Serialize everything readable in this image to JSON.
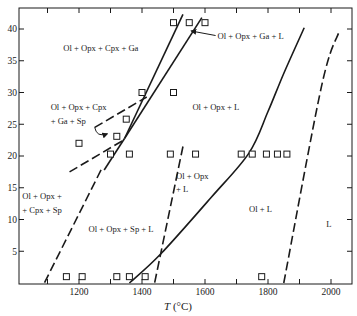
{
  "figure": {
    "xlabel_symbol": "T",
    "xlabel_unit": " (°C)",
    "colors": {
      "ink": "#1a1a1a",
      "background": "#ffffff"
    }
  },
  "chart_data": {
    "type": "phase-diagram",
    "title": "",
    "xlabel": "T (°C)",
    "ylabel": "",
    "xlim": [
      1010,
      2065
    ],
    "ylim": [
      0,
      40.5
    ],
    "x_ticks": [
      1100,
      1200,
      1300,
      1400,
      1500,
      1600,
      1700,
      1800,
      1900,
      2000
    ],
    "x_tick_labels": [
      "1200",
      "1400",
      "1600",
      "1800",
      "2000"
    ],
    "x_tick_label_values": [
      1200,
      1400,
      1600,
      1800,
      2000
    ],
    "y_ticks": [
      5,
      10,
      15,
      20,
      25,
      30,
      35,
      40
    ],
    "y_tick_labels": [
      "5",
      "10",
      "15",
      "20",
      "25",
      "30",
      "35",
      "40"
    ],
    "grid": false,
    "regions": [
      {
        "label": "Ol + Opx + Cpx + Ga",
        "T": 1150,
        "P": 36.5
      },
      {
        "label": "Ol + Opx + Ga + L",
        "T": 1640,
        "P": 38.5,
        "arrow_to": {
          "T": 1550,
          "P": 40
        }
      },
      {
        "label": "Ol + Opx + Cpx",
        "T": 1110,
        "P": 27.3
      },
      {
        "label": "+ Ga + Sp",
        "T": 1110,
        "P": 25.0,
        "arrow_to": {
          "T": 1290,
          "P": 23.5
        }
      },
      {
        "label": "Ol + Opx + L",
        "T": 1560,
        "P": 27.3
      },
      {
        "label": "Ol + Opx",
        "T": 1508,
        "P": 16.3
      },
      {
        "label": "+ L",
        "T": 1508,
        "P": 14.3
      },
      {
        "label": "Ol + Opx +",
        "T": 1020,
        "P": 13.2
      },
      {
        "label": "+ Cpx + Sp",
        "T": 1020,
        "P": 11.0
      },
      {
        "label": "Ol + Opx + Sp + L",
        "T": 1230,
        "P": 8.0
      },
      {
        "label": "Ol + L",
        "T": 1740,
        "P": 11.2
      },
      {
        "label": "L",
        "T": 1985,
        "P": 8.8
      }
    ],
    "boundaries": [
      {
        "name": "garnet-out-solidus-upper",
        "style": "solid",
        "points": [
          [
            1345,
            22.8
          ],
          [
            1530,
            42.3
          ]
        ]
      },
      {
        "name": "garnet-in-upper",
        "style": "solid",
        "points": [
          [
            1345,
            22.8
          ],
          [
            1590,
            41.8
          ]
        ]
      },
      {
        "name": "cpx-out-lower-solid",
        "style": "solid",
        "points": [
          [
            1280,
            17.8
          ],
          [
            1345,
            22.8
          ]
        ]
      },
      {
        "name": "cpx-out-lower-dashed",
        "style": "dashed",
        "points": [
          [
            1270,
            17.8
          ],
          [
            1090,
            0
          ]
        ]
      },
      {
        "name": "ga-sp-lower-dashed",
        "style": "dashed",
        "points": [
          [
            1170,
            17.5
          ],
          [
            1345,
            22.6
          ]
        ]
      },
      {
        "name": "ga-sp-upper-dashed",
        "style": "dashed",
        "points": [
          [
            1250,
            24.5
          ],
          [
            1415,
            29.3
          ]
        ]
      },
      {
        "name": "sp-out-dashed",
        "style": "dashed",
        "points": [
          [
            1530,
            21.5
          ],
          [
            1440,
            0
          ]
        ]
      },
      {
        "name": "opx-out-solid",
        "style": "solid",
        "points": [
          [
            1360,
            0
          ],
          [
            1460,
            4.6
          ],
          [
            1620,
            13.5
          ],
          [
            1740,
            20.5
          ],
          [
            1800,
            27
          ],
          [
            1850,
            33
          ],
          [
            1915,
            40.2
          ]
        ]
      },
      {
        "name": "liquidus-dashed",
        "style": "dashed",
        "points": [
          [
            1850,
            0
          ],
          [
            1970,
            31
          ],
          [
            2025,
            39.5
          ]
        ]
      }
    ],
    "experiments": [
      {
        "T": 1500,
        "P": 41
      },
      {
        "T": 1550,
        "P": 41
      },
      {
        "T": 1600,
        "P": 41
      },
      {
        "T": 1400,
        "P": 30
      },
      {
        "T": 1500,
        "P": 30
      },
      {
        "T": 1350,
        "P": 25.8
      },
      {
        "T": 1320,
        "P": 23.1
      },
      {
        "T": 1200,
        "P": 22
      },
      {
        "T": 1300,
        "P": 20.3
      },
      {
        "T": 1360,
        "P": 20.3
      },
      {
        "T": 1490,
        "P": 20.3
      },
      {
        "T": 1570,
        "P": 20.3
      },
      {
        "T": 1715,
        "P": 20.3
      },
      {
        "T": 1750,
        "P": 20.3
      },
      {
        "T": 1795,
        "P": 20.3
      },
      {
        "T": 1830,
        "P": 20.3
      },
      {
        "T": 1860,
        "P": 20.3
      },
      {
        "T": 1160,
        "P": 1
      },
      {
        "T": 1210,
        "P": 1
      },
      {
        "T": 1320,
        "P": 1
      },
      {
        "T": 1360,
        "P": 1
      },
      {
        "T": 1410,
        "P": 1
      },
      {
        "T": 1780,
        "P": 1
      }
    ]
  }
}
